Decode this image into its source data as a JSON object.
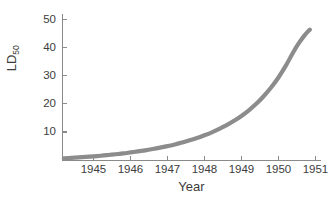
{
  "chart_data": {
    "type": "line",
    "title": "",
    "xlabel": "Year",
    "ylabel": "LD50",
    "ylabel_base": "LD",
    "ylabel_sub": "50",
    "xlim": [
      1944.15,
      1951.15
    ],
    "ylim": [
      0,
      52
    ],
    "grid": false,
    "legend": null,
    "series": [
      {
        "name": "LD50",
        "color": "#8c8c8c",
        "line_width": 4.2,
        "x": [
          1944.2,
          1944.4,
          1944.6,
          1944.8,
          1945.0,
          1945.2,
          1945.4,
          1945.6,
          1945.8,
          1946.0,
          1946.2,
          1946.4,
          1946.6,
          1946.8,
          1947.0,
          1947.2,
          1947.4,
          1947.6,
          1947.8,
          1948.0,
          1948.2,
          1948.4,
          1948.6,
          1948.8,
          1949.0,
          1949.2,
          1949.4,
          1949.6,
          1949.8,
          1950.0,
          1950.2,
          1950.4,
          1950.55,
          1950.7,
          1950.8,
          1950.85
        ],
        "y": [
          0.6,
          0.75,
          0.92,
          1.1,
          1.3,
          1.52,
          1.78,
          2.05,
          2.35,
          2.7,
          3.05,
          3.45,
          3.9,
          4.4,
          4.95,
          5.55,
          6.25,
          7.0,
          7.85,
          8.8,
          9.85,
          11.05,
          12.4,
          13.95,
          15.7,
          17.7,
          20.0,
          22.7,
          25.8,
          29.4,
          33.6,
          38.4,
          41.6,
          44.3,
          45.8,
          46.4
        ]
      }
    ],
    "xticks": [
      {
        "value": 1945,
        "label": "1945"
      },
      {
        "value": 1946,
        "label": "1946"
      },
      {
        "value": 1947,
        "label": "1947"
      },
      {
        "value": 1948,
        "label": "1948"
      },
      {
        "value": 1949,
        "label": "1949"
      },
      {
        "value": 1950,
        "label": "1950"
      },
      {
        "value": 1951,
        "label": "1951"
      }
    ],
    "yticks": [
      {
        "value": 10,
        "label": "10"
      },
      {
        "value": 20,
        "label": "20"
      },
      {
        "value": 30,
        "label": "30"
      },
      {
        "value": 40,
        "label": "40"
      },
      {
        "value": 50,
        "label": "50"
      }
    ],
    "axis_color": "#8a8a8a",
    "text_color": "#3c3c3c",
    "background": "#ffffff"
  }
}
